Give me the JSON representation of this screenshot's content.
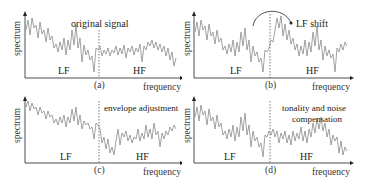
{
  "figure": {
    "axis_labels": {
      "y": "spectrum",
      "x": "frequency"
    },
    "bands": {
      "low": "LF",
      "high": "HF"
    },
    "colors": {
      "signal": "#8a8a8a",
      "axis": "#222222",
      "text": "#222222"
    },
    "panels": [
      {
        "id": "a",
        "caption": "(a)",
        "annotation": "original signal"
      },
      {
        "id": "b",
        "caption": "(b)",
        "annotation": "LF shift"
      },
      {
        "id": "c",
        "caption": "(c)",
        "annotation": "envelope adjustment"
      },
      {
        "id": "d",
        "caption": "(d)",
        "annotation_line1": "tonality and noise",
        "annotation_line2": "compensation"
      }
    ]
  }
}
